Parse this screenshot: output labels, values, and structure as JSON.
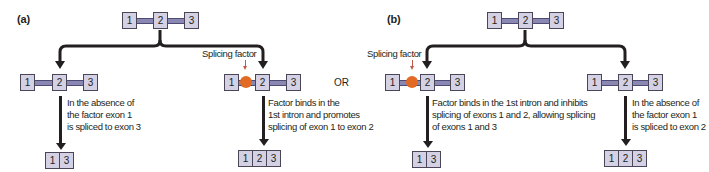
{
  "figure": {
    "colors": {
      "exon_fill": "#d3d1e3",
      "exon_border": "#4a4658",
      "intron": "#8a87b3",
      "splicing_factor": "#e36a24",
      "factor_arrow": "#c4584a",
      "arrow": "#231f20"
    },
    "separator_label": "OR",
    "panels": [
      {
        "label": "(a)",
        "pre_mrna_exons": [
          "1",
          "2",
          "3"
        ],
        "left_branch": {
          "gene_exons": [
            "1",
            "2",
            "3"
          ],
          "has_factor": false,
          "note_lines": [
            "In the absence of",
            "the factor exon 1",
            "is spliced to exon 3"
          ],
          "product_exons": [
            "1",
            "3"
          ]
        },
        "right_branch": {
          "factor_label": "Splicing factor",
          "gene_exons": [
            "1",
            "2",
            "3"
          ],
          "has_factor": true,
          "note_lines": [
            "Factor binds in the",
            "1st intron and promotes",
            "splicing of exon 1 to exon 2"
          ],
          "product_exons": [
            "1",
            "2",
            "3"
          ]
        }
      },
      {
        "label": "(b)",
        "pre_mrna_exons": [
          "1",
          "2",
          "3"
        ],
        "left_branch": {
          "factor_label": "Splicing factor",
          "gene_exons": [
            "1",
            "2",
            "3"
          ],
          "has_factor": true,
          "note_lines": [
            "Factor binds in the 1st intron and inhibits",
            "splicing of exons 1 and 2, allowing splicing",
            "of exons 1 and 3"
          ],
          "product_exons": [
            "1",
            "3"
          ]
        },
        "right_branch": {
          "gene_exons": [
            "1",
            "2",
            "3"
          ],
          "has_factor": false,
          "note_lines": [
            "In the absence of",
            "the factor exon 1",
            "is spliced to exon 2"
          ],
          "product_exons": [
            "1",
            "2",
            "3"
          ]
        }
      }
    ]
  }
}
